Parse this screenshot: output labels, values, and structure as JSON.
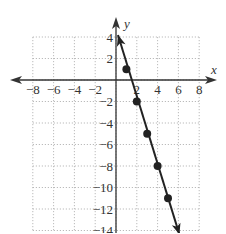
{
  "chart_data": {
    "type": "line",
    "title": "",
    "xlabel": "x",
    "ylabel": "y",
    "xlim": [
      -8,
      8
    ],
    "ylim": [
      -14,
      4
    ],
    "grid": true,
    "grid_style": "dotted",
    "x_ticks": [
      "-8",
      "-6",
      "-4",
      "-2",
      "2",
      "4",
      "6",
      "8"
    ],
    "y_ticks": [
      "4",
      "2",
      "-2",
      "-4",
      "-6",
      "-8",
      "-10",
      "-12",
      "-14"
    ],
    "series": [
      {
        "name": "y = -3x + 4",
        "points": [
          [
            1,
            1
          ],
          [
            2,
            -2
          ],
          [
            3,
            -5
          ],
          [
            4,
            -8
          ],
          [
            5,
            -11
          ]
        ],
        "line_extends_from": [
          0,
          4
        ],
        "line_extends_to": [
          6,
          -14
        ],
        "arrows_both_ends": true,
        "marker": "filled-circle",
        "color": "#222222"
      }
    ]
  }
}
